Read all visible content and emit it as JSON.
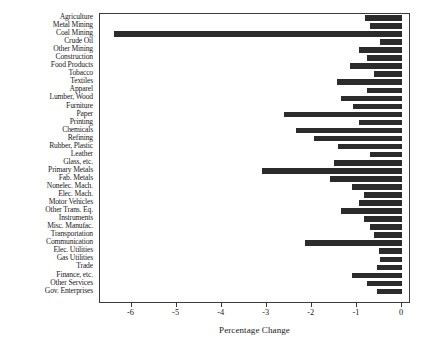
{
  "chart_data": {
    "type": "bar",
    "orientation": "horizontal",
    "title": "",
    "xlabel": "Percentage Change",
    "ylabel": "",
    "xlim": [
      -6.7,
      0.2
    ],
    "ylim": null,
    "grid": false,
    "legend": null,
    "bar_color": "#2b2b2b",
    "panel_border_color": "#3a3a3a",
    "background": "#ffffff",
    "xticks": [
      -6,
      -5,
      -4,
      -3,
      -2,
      -1,
      0
    ],
    "xticklabels": [
      "-6",
      "-5",
      "-4",
      "-3",
      "-2",
      "-1",
      "0"
    ],
    "categories": [
      "Agriculture",
      "Metal Mining",
      "Coal Mining",
      "Crude Oil",
      "Other Mining",
      "Construction",
      "Food Products",
      "Tobacco",
      "Textiles",
      "Apparel",
      "Lumber, Wood",
      "Furniture",
      "Paper",
      "Printing",
      "Chemicals",
      "Refining",
      "Rubber, Plastic",
      "Leather",
      "Glass, etc.",
      "Primary Metals",
      "Fab. Metals",
      "Nonelec. Mach.",
      "Elec. Mach.",
      "Motor Vehicles",
      "Other Trans. Eq.",
      "Instruments",
      "Misc. Manufac.",
      "Transportation",
      "Communication",
      "Elec. Utilities",
      "Gas Utilities",
      "Trade",
      "Finance, etc.",
      "Other Services",
      "Gov. Enterprises"
    ],
    "values": [
      -0.82,
      -0.72,
      -6.4,
      -0.48,
      -0.95,
      -0.78,
      -1.15,
      -0.62,
      -1.45,
      -0.78,
      -1.35,
      -1.08,
      -2.62,
      -0.95,
      -2.35,
      -1.95,
      -1.42,
      -0.72,
      -1.5,
      -3.1,
      -1.6,
      -1.12,
      -0.85,
      -0.95,
      -1.35,
      -0.85,
      -0.72,
      -0.62,
      -2.15,
      -0.52,
      -0.48,
      -0.55,
      -1.12,
      -0.78,
      -0.55
    ]
  }
}
